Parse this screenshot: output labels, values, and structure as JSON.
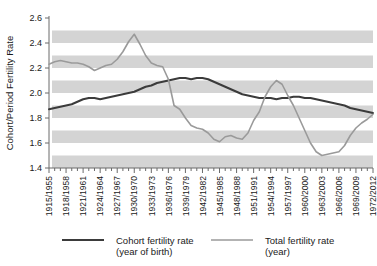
{
  "chart_data": {
    "type": "line",
    "title": "",
    "xlabel": "",
    "ylabel": "Cohort/Period Fertility Rate",
    "ylim": [
      1.4,
      2.6
    ],
    "yticks": [
      1.4,
      1.6,
      1.8,
      2.0,
      2.2,
      2.4,
      2.6
    ],
    "ytick_labels": [
      "1.4",
      "1.6",
      "1.8",
      "2.0",
      "2.2",
      "2.4",
      "2.6"
    ],
    "grid": "horizontal-banded",
    "bands": [
      [
        1.4,
        1.5
      ],
      [
        1.6,
        1.7
      ],
      [
        1.8,
        1.9
      ],
      [
        2.0,
        2.1
      ],
      [
        2.2,
        2.3
      ],
      [
        2.4,
        2.5
      ]
    ],
    "band_color": "#d4d4d4",
    "legend_position": "bottom",
    "categories": [
      "1915/1955",
      "1918/1958",
      "1921/1961",
      "1924/1964",
      "1927/1967",
      "1930/1970",
      "1933/1973",
      "1936/1976",
      "1939/1979",
      "1942/1982",
      "1945/1985",
      "1948/1988",
      "1951/1991",
      "1954/1994",
      "1957/1997",
      "1960/2000",
      "1963/2003",
      "1966/2006",
      "1969/2009",
      "1972/2012"
    ],
    "x_minor_ticks_per_category": 3,
    "series": [
      {
        "name": "Cohort fertility rate (year of birth)",
        "legend_line1": "Cohort fertility rate",
        "legend_line2": "(year of birth)",
        "color": "#3b3b3b",
        "width": 2.0,
        "x": [
          0,
          1,
          2,
          3,
          4,
          5,
          6,
          7,
          8,
          9,
          10,
          11,
          12,
          13,
          14,
          15,
          16,
          17,
          18,
          19,
          20,
          21,
          22,
          23,
          24,
          25,
          26,
          27,
          28,
          29,
          30,
          31,
          32,
          33,
          34,
          35,
          36,
          37,
          38,
          39,
          40,
          41,
          42,
          43,
          44,
          45,
          46,
          47,
          48,
          49,
          50,
          51,
          52,
          53,
          54,
          55,
          56,
          57
        ],
        "values": [
          1.87,
          1.88,
          1.89,
          1.9,
          1.91,
          1.93,
          1.95,
          1.96,
          1.96,
          1.95,
          1.96,
          1.97,
          1.98,
          1.99,
          2.0,
          2.01,
          2.03,
          2.05,
          2.06,
          2.08,
          2.09,
          2.1,
          2.11,
          2.12,
          2.12,
          2.11,
          2.12,
          2.12,
          2.11,
          2.09,
          2.07,
          2.05,
          2.03,
          2.01,
          1.99,
          1.98,
          1.97,
          1.96,
          1.96,
          1.96,
          1.95,
          1.96,
          1.96,
          1.97,
          1.97,
          1.96,
          1.96,
          1.95,
          1.94,
          1.93,
          1.92,
          1.91,
          1.9,
          1.88,
          1.87,
          1.86,
          1.85,
          1.84
        ]
      },
      {
        "name": "Total fertility rate (year)",
        "legend_line1": "Total fertility rate",
        "legend_line2": "(year)",
        "color": "#9a9a9a",
        "width": 1.6,
        "x": [
          0,
          1,
          2,
          3,
          4,
          5,
          6,
          7,
          8,
          9,
          10,
          11,
          12,
          13,
          14,
          15,
          16,
          17,
          18,
          19,
          20,
          21,
          22,
          23,
          24,
          25,
          26,
          27,
          28,
          29,
          30,
          31,
          32,
          33,
          34,
          35,
          36,
          37,
          38,
          39,
          40,
          41,
          42,
          43,
          44,
          45,
          46,
          47,
          48,
          49,
          50,
          51,
          52,
          53,
          54,
          55,
          56,
          57
        ],
        "values": [
          2.23,
          2.25,
          2.26,
          2.25,
          2.24,
          2.24,
          2.23,
          2.21,
          2.18,
          2.2,
          2.22,
          2.23,
          2.27,
          2.33,
          2.41,
          2.47,
          2.39,
          2.3,
          2.24,
          2.22,
          2.21,
          2.11,
          1.9,
          1.87,
          1.8,
          1.74,
          1.72,
          1.71,
          1.68,
          1.63,
          1.61,
          1.65,
          1.66,
          1.64,
          1.63,
          1.68,
          1.78,
          1.85,
          1.97,
          2.05,
          2.1,
          2.07,
          1.98,
          1.9,
          1.8,
          1.7,
          1.6,
          1.53,
          1.5,
          1.51,
          1.52,
          1.53,
          1.58,
          1.66,
          1.72,
          1.76,
          1.79,
          1.83
        ]
      }
    ]
  },
  "legend": {
    "items": [
      {
        "line1": "Cohort fertility rate",
        "line2": "(year of birth)",
        "color": "#3b3b3b",
        "width": 2.2
      },
      {
        "line1": "Total fertility rate",
        "line2": "(year)",
        "color": "#9a9a9a",
        "width": 1.6
      }
    ]
  }
}
